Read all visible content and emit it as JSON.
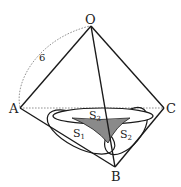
{
  "diagram": {
    "type": "geometry-tetrahedron",
    "colors": {
      "line": "#1a1a1a",
      "dashed": "#666666",
      "shade": "#8a8a8a",
      "background": "#ffffff"
    },
    "vertices": {
      "O": {
        "label": "O"
      },
      "A": {
        "label": "A"
      },
      "B": {
        "label": "B"
      },
      "C": {
        "label": "C"
      }
    },
    "edge_label": "6",
    "regions": [
      {
        "label": "S",
        "sub": "1"
      },
      {
        "label": "S",
        "sub": "2"
      },
      {
        "label": "S",
        "sub": "3"
      }
    ]
  }
}
